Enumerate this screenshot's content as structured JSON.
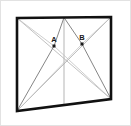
{
  "figure": {
    "background_color": "#ffffff",
    "outer_border_color": "#e2e2e2",
    "frame_color": "#111111",
    "construction_line_color": "#b9b9b9",
    "ray_line_color": "#8c8c8c",
    "vertical_line_color": "#adadad",
    "point_marker_color": "#1a1a1a",
    "label_color": "#1a1a1a"
  },
  "quad": {
    "name": "screen-outline",
    "corners": {
      "top_left": {
        "x": 17,
        "y": 18
      },
      "top_right": {
        "x": 111,
        "y": 17
      },
      "bottom_right": {
        "x": 111,
        "y": 99
      },
      "bottom_left": {
        "x": 17,
        "y": 111
      }
    },
    "stroke_width": 2.6
  },
  "points": [
    {
      "id": "A",
      "label": "A",
      "x": 54,
      "y": 46,
      "label_x": 54,
      "label_y": 41,
      "marker_size": 3
    },
    {
      "id": "B",
      "label": "B",
      "x": 82,
      "y": 44,
      "label_x": 82,
      "label_y": 39,
      "marker_size": 3
    }
  ],
  "construction_lines": [
    {
      "name": "diagonal-tl-br",
      "x1": 17,
      "y1": 18,
      "x2": 111,
      "y2": 99
    },
    {
      "name": "diagonal-tr-bl",
      "x1": 111,
      "y1": 17,
      "x2": 17,
      "y2": 111
    },
    {
      "name": "vertical-center",
      "x1": 64,
      "y1": 17.5,
      "x2": 64,
      "y2": 105
    }
  ],
  "rays": [
    {
      "name": "ray-A-to-top-center",
      "x1": 54,
      "y1": 46,
      "x2": 64,
      "y2": 17.5
    },
    {
      "name": "ray-A-to-bottom-left",
      "x1": 54,
      "y1": 46,
      "x2": 17,
      "y2": 111
    },
    {
      "name": "ray-A-to-top-left",
      "x1": 54,
      "y1": 46,
      "x2": 17,
      "y2": 18
    },
    {
      "name": "ray-A-to-bottom-right",
      "x1": 54,
      "y1": 46,
      "x2": 111,
      "y2": 99
    },
    {
      "name": "ray-B-to-top-center",
      "x1": 82,
      "y1": 44,
      "x2": 64,
      "y2": 17.5
    },
    {
      "name": "ray-B-to-bottom-right",
      "x1": 82,
      "y1": 44,
      "x2": 111,
      "y2": 99
    },
    {
      "name": "ray-B-to-top-right",
      "x1": 82,
      "y1": 44,
      "x2": 111,
      "y2": 17
    },
    {
      "name": "ray-B-to-bottom-left",
      "x1": 82,
      "y1": 44,
      "x2": 17,
      "y2": 111
    }
  ]
}
